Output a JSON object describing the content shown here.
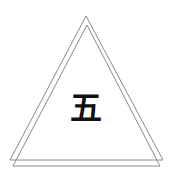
{
  "figure": {
    "character": "五",
    "stroke_color": "#8a8a8a",
    "text_color": "#111111",
    "shapes": [
      {
        "type": "triangle",
        "points": "86,16 10,160 163,160"
      },
      {
        "type": "triangle",
        "points": "87,25 13,166 160,166"
      }
    ]
  }
}
